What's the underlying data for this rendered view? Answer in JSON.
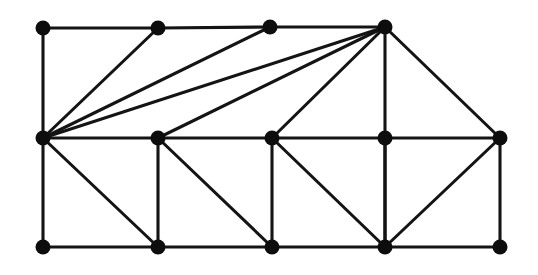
{
  "figure": {
    "canvas": {
      "width": 538,
      "height": 275,
      "background": "#ffffff"
    },
    "style": {
      "edge_color": "#141414",
      "edge_width": 3.1,
      "vertex_color": "#0d0d0d",
      "vertex_radius": 7.5
    },
    "counts": {
      "vertices": 14,
      "edges": 30
    }
  },
  "chart_data": {
    "type": "diagram",
    "xlabel": "",
    "ylabel": "",
    "vertices": [
      {
        "id": "T0",
        "label": "",
        "x": 43,
        "y": 28,
        "row": "top"
      },
      {
        "id": "T1",
        "label": "",
        "x": 158,
        "y": 28,
        "row": "top"
      },
      {
        "id": "T2",
        "label": "",
        "x": 270,
        "y": 27,
        "row": "top"
      },
      {
        "id": "T3",
        "label": "",
        "x": 385,
        "y": 27,
        "row": "top"
      },
      {
        "id": "M0",
        "label": "",
        "x": 43,
        "y": 138,
        "row": "middle"
      },
      {
        "id": "M1",
        "label": "",
        "x": 158,
        "y": 138,
        "row": "middle"
      },
      {
        "id": "M2",
        "label": "",
        "x": 272,
        "y": 138,
        "row": "middle"
      },
      {
        "id": "M3",
        "label": "",
        "x": 385,
        "y": 138,
        "row": "middle"
      },
      {
        "id": "M4",
        "label": "",
        "x": 500,
        "y": 138,
        "row": "middle"
      },
      {
        "id": "B0",
        "label": "",
        "x": 43,
        "y": 247,
        "row": "bottom"
      },
      {
        "id": "B1",
        "label": "",
        "x": 158,
        "y": 247,
        "row": "bottom"
      },
      {
        "id": "B2",
        "label": "",
        "x": 272,
        "y": 247,
        "row": "bottom"
      },
      {
        "id": "B3",
        "label": "",
        "x": 385,
        "y": 247,
        "row": "bottom"
      },
      {
        "id": "B4",
        "label": "",
        "x": 500,
        "y": 247,
        "row": "bottom"
      }
    ],
    "edges": [
      {
        "from": "T0",
        "to": "T1",
        "kind": "horizontal"
      },
      {
        "from": "T1",
        "to": "T2",
        "kind": "horizontal"
      },
      {
        "from": "T2",
        "to": "T3",
        "kind": "horizontal"
      },
      {
        "from": "M0",
        "to": "M1",
        "kind": "horizontal"
      },
      {
        "from": "M1",
        "to": "M2",
        "kind": "horizontal"
      },
      {
        "from": "M2",
        "to": "M3",
        "kind": "horizontal"
      },
      {
        "from": "M3",
        "to": "M4",
        "kind": "horizontal"
      },
      {
        "from": "B0",
        "to": "B1",
        "kind": "horizontal"
      },
      {
        "from": "B1",
        "to": "B2",
        "kind": "horizontal"
      },
      {
        "from": "B2",
        "to": "B3",
        "kind": "horizontal"
      },
      {
        "from": "B3",
        "to": "B4",
        "kind": "horizontal"
      },
      {
        "from": "T0",
        "to": "M0",
        "kind": "vertical"
      },
      {
        "from": "T3",
        "to": "M3",
        "kind": "vertical"
      },
      {
        "from": "M0",
        "to": "B0",
        "kind": "vertical"
      },
      {
        "from": "M1",
        "to": "B1",
        "kind": "vertical"
      },
      {
        "from": "M2",
        "to": "B2",
        "kind": "vertical"
      },
      {
        "from": "M3",
        "to": "B3",
        "kind": "vertical"
      },
      {
        "from": "M4",
        "to": "B4",
        "kind": "vertical"
      },
      {
        "from": "M0",
        "to": "T1",
        "kind": "fan-left"
      },
      {
        "from": "M0",
        "to": "T2",
        "kind": "fan-left"
      },
      {
        "from": "M0",
        "to": "T3",
        "kind": "fan-left"
      },
      {
        "from": "M1",
        "to": "T3",
        "kind": "fan-hub"
      },
      {
        "from": "M2",
        "to": "T3",
        "kind": "fan-hub"
      },
      {
        "from": "T3",
        "to": "M4",
        "kind": "fan-hub"
      },
      {
        "from": "M0",
        "to": "B1",
        "kind": "diagonal"
      },
      {
        "from": "M1",
        "to": "B2",
        "kind": "diagonal"
      },
      {
        "from": "M2",
        "to": "B3",
        "kind": "diagonal"
      },
      {
        "from": "M3",
        "to": "B3",
        "kind": "vertical"
      },
      {
        "from": "M4",
        "to": "B3",
        "kind": "diagonal"
      }
    ]
  }
}
